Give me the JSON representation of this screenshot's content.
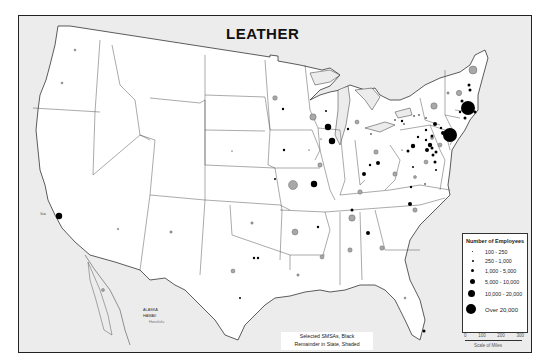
{
  "title": "LEATHER",
  "legend": {
    "title": "Number of Employees",
    "items": [
      {
        "label": "100 - 250",
        "size": 1.5
      },
      {
        "label": "250 - 1,000",
        "size": 2.5
      },
      {
        "label": "1,000 - 5,000",
        "size": 3.5
      },
      {
        "label": "5,000 - 10,000",
        "size": 5
      },
      {
        "label": "10,000 - 20,000",
        "size": 7
      },
      {
        "label": "Over 20,000",
        "size": 9
      }
    ]
  },
  "scale": {
    "ticks": [
      "0",
      "100",
      "200",
      "300"
    ],
    "label": "Scale of Miles"
  },
  "note": {
    "line1": "Selected SMSAs, Black",
    "line2": "Remainder in State, Shaded"
  },
  "inset_labels": {
    "alaska": "ALASKA",
    "hawaii": "HAWAII",
    "honolulu": "Honolulu"
  },
  "city_label": "Tole",
  "colors": {
    "land": "#ffffff",
    "water": "#ececec",
    "smsa": "#000000",
    "state_remainder": "#a8a8a8",
    "border": "#333333"
  }
}
